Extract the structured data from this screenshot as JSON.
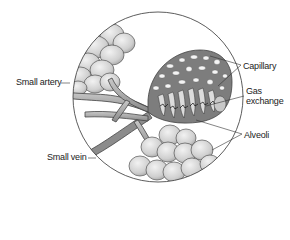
{
  "diagram": {
    "labels": {
      "small_artery": "Small artery",
      "small_vein": "Small vein",
      "capillary": "Capillary",
      "gas_exchange_line1": "Gas",
      "gas_exchange_line2": "exchange",
      "alveoli": "Alveoli"
    },
    "colors": {
      "outline": "#333333",
      "alveolus_fill": "#d4d4d4",
      "capillary_fill": "#7a7a7a",
      "vessel_fill": "#9a9a9a",
      "background": "#ffffff"
    }
  }
}
